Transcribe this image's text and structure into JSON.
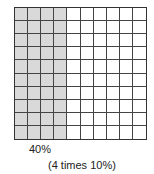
{
  "diagram": {
    "type": "hundred-grid",
    "rows": 10,
    "columns": 10,
    "shaded_columns": 4,
    "shaded_color": "#d9d9d9",
    "line_color": "#444444"
  },
  "labels": {
    "percent": "40%",
    "explanation": "(4 times 10%)"
  }
}
